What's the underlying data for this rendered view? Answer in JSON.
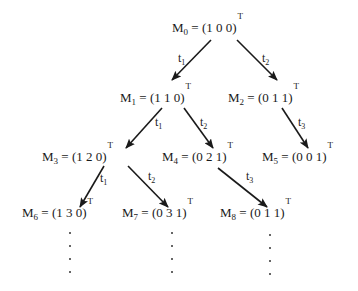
{
  "diagram": {
    "type": "reachability-tree",
    "transpose_symbol": "T",
    "nodes": [
      {
        "id": "M0",
        "name": "M",
        "index": "0",
        "vector": "(1 0 0)",
        "x": 172,
        "y": 21
      },
      {
        "id": "M1",
        "name": "M",
        "index": "1",
        "vector": "(1 1 0)",
        "x": 120,
        "y": 91
      },
      {
        "id": "M2",
        "name": "M",
        "index": "2",
        "vector": "(0 1 1)",
        "x": 228,
        "y": 91
      },
      {
        "id": "M3",
        "name": "M",
        "index": "3",
        "vector": "(1 2 0)",
        "x": 42,
        "y": 150
      },
      {
        "id": "M4",
        "name": "M",
        "index": "4",
        "vector": "(0 2 1)",
        "x": 162,
        "y": 150
      },
      {
        "id": "M5",
        "name": "M",
        "index": "5",
        "vector": "(0 0 1)",
        "x": 262,
        "y": 150
      },
      {
        "id": "M6",
        "name": "M",
        "index": "6",
        "vector": "(1 3 0)",
        "x": 22,
        "y": 206
      },
      {
        "id": "M7",
        "name": "M",
        "index": "7",
        "vector": "(0 3 1)",
        "x": 122,
        "y": 206
      },
      {
        "id": "M8",
        "name": "M",
        "index": "8",
        "vector": "(0 1 1)",
        "x": 220,
        "y": 206
      }
    ],
    "edges": [
      {
        "from": "M0",
        "to": "M1",
        "label": "t",
        "label_index": "1"
      },
      {
        "from": "M0",
        "to": "M2",
        "label": "t",
        "label_index": "2"
      },
      {
        "from": "M1",
        "to": "M3",
        "label": "t",
        "label_index": "1"
      },
      {
        "from": "M1",
        "to": "M4",
        "label": "t",
        "label_index": "2"
      },
      {
        "from": "M2",
        "to": "M5",
        "label": "t",
        "label_index": "3"
      },
      {
        "from": "M3",
        "to": "M6",
        "label": "t",
        "label_index": "1"
      },
      {
        "from": "M3",
        "to": "M7",
        "label": "t",
        "label_index": "2"
      },
      {
        "from": "M4",
        "to": "M8",
        "label": "t",
        "label_index": "3"
      }
    ],
    "continuation": "vertical ellipsis below M6, M7, M8"
  }
}
